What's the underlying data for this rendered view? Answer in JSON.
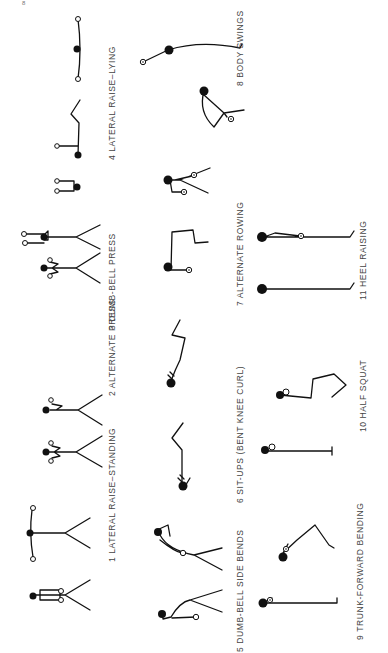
{
  "page": {
    "page_number": "8",
    "orientation": "rotated-90-ccw",
    "exercises": [
      {
        "number": "1",
        "label": "1 LATERAL RAISE–STANDING"
      },
      {
        "number": "2",
        "label": "2 ALTERNATE PRESS"
      },
      {
        "number": "3",
        "label": "3 DUMB-BELL PRESS"
      },
      {
        "number": "4",
        "label": "4 LATERAL RAISE–LYING"
      },
      {
        "number": "5",
        "label": "5 DUMB-BELL SIDE BENDS"
      },
      {
        "number": "6",
        "label": "6 SIT-UPS (BENT KNEE CURL)"
      },
      {
        "number": "7",
        "label": "7 ALTERNATE ROWING"
      },
      {
        "number": "8",
        "label": "8 BODY SWINGS"
      },
      {
        "number": "9",
        "label": "9 TRUNK-FORWARD BENDING"
      },
      {
        "number": "10",
        "label": "10 HALF SQUAT"
      },
      {
        "number": "11",
        "label": "11 HEEL RAISING"
      }
    ]
  },
  "colors": {
    "figure_ink": "#111111",
    "label_text": "#444444",
    "background": "#ffffff"
  }
}
